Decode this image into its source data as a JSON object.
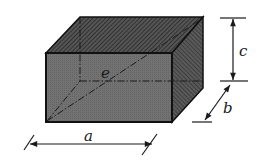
{
  "diagram": {
    "labels": {
      "length": "a",
      "width": "b",
      "height": "c",
      "diagonal": "e"
    },
    "colors": {
      "front_face": "#6e6e6e",
      "top_face": "#3c3c3c",
      "side_face": "#4a4a4a",
      "edge": "#111111",
      "dimension_line": "#1a1a1a"
    }
  }
}
